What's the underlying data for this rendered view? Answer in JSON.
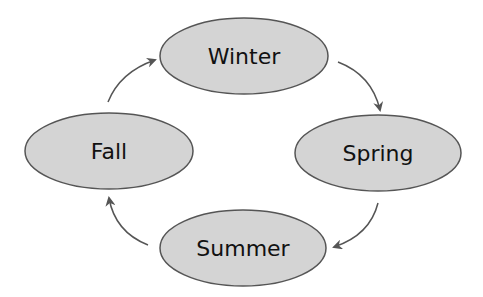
{
  "diagram": {
    "type": "cycle",
    "colors": {
      "node_fill": "#d4d4d4",
      "node_stroke": "#555555",
      "arrow": "#555555",
      "text": "#111111"
    },
    "nodes": [
      {
        "id": "winter",
        "label": "Winter"
      },
      {
        "id": "spring",
        "label": "Spring"
      },
      {
        "id": "summer",
        "label": "Summer"
      },
      {
        "id": "fall",
        "label": "Fall"
      }
    ],
    "edges": [
      {
        "from": "winter",
        "to": "spring"
      },
      {
        "from": "spring",
        "to": "summer"
      },
      {
        "from": "summer",
        "to": "fall"
      },
      {
        "from": "fall",
        "to": "winter"
      }
    ]
  }
}
